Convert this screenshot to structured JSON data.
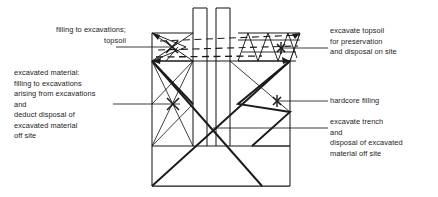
{
  "diagram": {
    "colors": {
      "line": "#1b1b1b",
      "background": "#ffffff",
      "text": "#1b1b1b"
    },
    "annotations": {
      "filling_to_excavations": {
        "name": "filling-to-excavations-topsoil",
        "lines": [
          "filling to excavations;",
          "topsoil"
        ]
      },
      "excavated_material": {
        "name": "excavated-material-block",
        "lines": [
          "excavated material:",
          "filling to excavations",
          "arising from excavations",
          "and",
          "deduct disposal of",
          "excavated material",
          "off site"
        ]
      },
      "excavate_topsoil": {
        "name": "excavate-topsoil-block",
        "lines": [
          "excavate topsoil",
          "for preservation",
          "and disposal on site"
        ]
      },
      "hardcore_filling": {
        "name": "hardcore-filling",
        "lines": [
          "hardcore filling"
        ]
      },
      "excavate_trench": {
        "name": "excavate-trench-block",
        "lines": [
          "excavate trench",
          "and",
          "disposal of excavated",
          "material off site"
        ]
      }
    }
  }
}
